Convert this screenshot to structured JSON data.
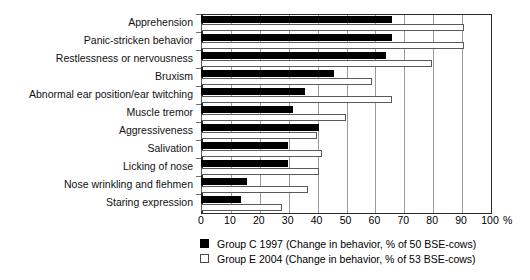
{
  "chart_data": {
    "type": "bar",
    "orientation": "horizontal",
    "title": "",
    "xlabel": "%",
    "ylabel": "",
    "xlim": [
      0,
      100
    ],
    "xticks": [
      0,
      10,
      20,
      30,
      40,
      50,
      60,
      70,
      80,
      90,
      100
    ],
    "xtick_labels": [
      "0",
      "10",
      "20",
      "30",
      "40",
      "50",
      "60",
      "70",
      "80",
      "90",
      "100"
    ],
    "x_unit_label": "%",
    "grid": true,
    "legend_position": "bottom-left",
    "categories": [
      "Apprehension",
      "Panic-stricken  behavior",
      "Restlessness or nervousness",
      "Bruxism",
      "Abnormal ear position/ear twitching",
      "Muscle tremor",
      "Aggressiveness",
      "Salivation",
      "Licking of nose",
      "Nose wrinkling and flehmen",
      "Staring expression"
    ],
    "series": [
      {
        "name": "Group C 1997 (Change in behavior, % of 50 BSE-cows)",
        "short_name": "Group C 1997",
        "color": "#000000",
        "style": "filled",
        "values": [
          66,
          66,
          64,
          46,
          36,
          32,
          41,
          30,
          30,
          16,
          14
        ]
      },
      {
        "name": "Group E 2004 (Change in behavior, % of 53 BSE-cows)",
        "short_name": "Group E 2004",
        "color": "#ffffff",
        "style": "outlined",
        "values": [
          91,
          91,
          80,
          59,
          66,
          50,
          40,
          42,
          41,
          37,
          28
        ]
      }
    ]
  },
  "legend": {
    "entries": [
      {
        "swatch": "filled-black-square",
        "label": "Group C 1997 (Change in behavior, % of 50 BSE-cows)"
      },
      {
        "swatch": "outlined-white-square",
        "label": "Group E 2004 (Change in behavior, % of 53 BSE-cows)"
      }
    ]
  },
  "colors": {
    "series_c": "#000000",
    "series_e": "#ffffff",
    "series_e_outline": "#5a5a5a",
    "gridline": "#9a9a9a",
    "axis": "#2b2b2b",
    "background": "#ffffff",
    "text": "#111111"
  }
}
